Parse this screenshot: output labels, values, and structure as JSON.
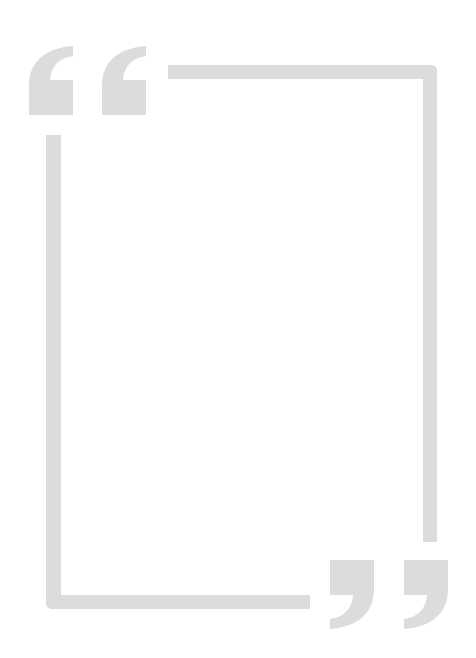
{
  "frame": {
    "color": "#dcdcdc",
    "background": "#ffffff",
    "open_quote_icon": "opening-double-quote",
    "close_quote_icon": "closing-double-quote",
    "body_text": ""
  }
}
